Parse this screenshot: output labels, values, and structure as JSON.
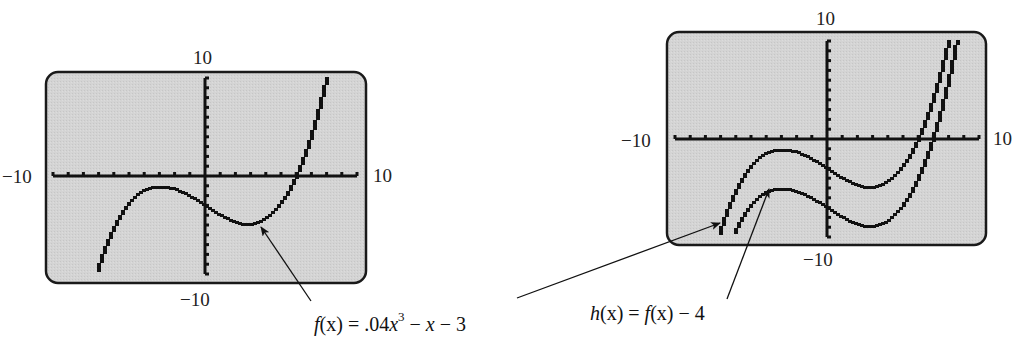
{
  "chart_data": [
    {
      "type": "line",
      "title": "Graphing calculator screen: f(x)",
      "xlabel": "",
      "ylabel": "",
      "xlim": [
        -10,
        10
      ],
      "ylim": [
        -10,
        10
      ],
      "tick_labels": {
        "x_min": "−10",
        "x_max": "10",
        "y_min": "−10",
        "y_max": "10"
      },
      "x_ticks_step": 1,
      "y_ticks_step": 1,
      "grid": false,
      "series": [
        {
          "name": "f(x) = .04x^3 − x − 3",
          "expression": "0.04*x^3 - x - 3",
          "x": [
            -7,
            -6,
            -5,
            -4,
            -3,
            -2,
            -1,
            0,
            1,
            2,
            3,
            4,
            5,
            6,
            7,
            8
          ],
          "values": [
            -9.72,
            -5.64,
            -3.0,
            -1.56,
            -1.08,
            -1.32,
            -2.04,
            -3.0,
            -3.96,
            -4.68,
            -4.92,
            -4.44,
            -3.0,
            -0.36,
            3.72,
            9.48
          ]
        }
      ],
      "annotations": [
        {
          "text": "f(x) = .04x³ − x − 3",
          "points_to": "local minimum of f near x = 2.9"
        }
      ]
    },
    {
      "type": "line",
      "title": "Graphing calculator screen: f(x) and h(x)",
      "xlabel": "",
      "ylabel": "",
      "xlim": [
        -10,
        10
      ],
      "ylim": [
        -10,
        10
      ],
      "tick_labels": {
        "x_min": "−10",
        "x_max": "10",
        "y_min": "−10",
        "y_max": "10"
      },
      "x_ticks_step": 1,
      "y_ticks_step": 1,
      "grid": false,
      "series": [
        {
          "name": "f(x) = .04x^3 − x − 3",
          "expression": "0.04*x^3 - x - 3",
          "x": [
            -7,
            -6,
            -5,
            -4,
            -3,
            -2,
            -1,
            0,
            1,
            2,
            3,
            4,
            5,
            6,
            7,
            8
          ],
          "values": [
            -9.72,
            -5.64,
            -3.0,
            -1.56,
            -1.08,
            -1.32,
            -2.04,
            -3.0,
            -3.96,
            -4.68,
            -4.92,
            -4.44,
            -3.0,
            -0.36,
            3.72,
            9.48
          ]
        },
        {
          "name": "h(x) = f(x) − 4",
          "expression": "0.04*x^3 - x - 7",
          "x": [
            -6,
            -5,
            -4,
            -3,
            -2,
            -1,
            0,
            1,
            2,
            3,
            4,
            5,
            6,
            7,
            8
          ],
          "values": [
            -9.64,
            -7.0,
            -5.56,
            -5.08,
            -5.32,
            -6.04,
            -7.0,
            -7.96,
            -8.68,
            -8.92,
            -8.44,
            -7.0,
            -4.36,
            -0.28,
            5.48
          ]
        }
      ],
      "annotations": [
        {
          "text": "f(x) = .04x³ − x − 3",
          "points_to": "left end of f on right screen"
        },
        {
          "text": "h(x) = f(x) − 4",
          "points_to": "local maximum of h near x = −2.9"
        }
      ]
    }
  ],
  "left_screen": {
    "label_top": "10",
    "label_bottom": "−10",
    "label_left": "−10",
    "label_right": "10"
  },
  "right_screen": {
    "label_top": "10",
    "label_bottom": "−10",
    "label_left": "−10",
    "label_right": "10"
  },
  "formulas": {
    "f_prefix": "f",
    "f_paren": "(x) = .04",
    "f_x": "x",
    "f_exp": "3",
    "f_rest": " − ",
    "f_x2": "x",
    "f_tail": " − 3",
    "h_name": "h",
    "h_mid": "(x) = ",
    "h_f": "f",
    "h_tail": "(x) − 4"
  },
  "colors": {
    "screen_fill": "#d2d2d2",
    "screen_border": "#1a1a1a",
    "ink": "#111111"
  }
}
